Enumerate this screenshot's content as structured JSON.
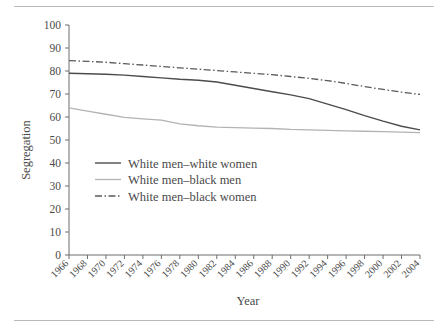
{
  "figure": {
    "top_rule": "horizontal-rule",
    "bottom_rule": "horizontal-rule"
  },
  "chart_data": {
    "type": "line",
    "title": "",
    "xlabel": "Year",
    "ylabel": "Segregation",
    "xlim": [
      1966,
      2004
    ],
    "ylim": [
      0,
      100
    ],
    "grid": false,
    "legend_position": "inside-lower-left",
    "yticks": [
      0,
      10,
      20,
      30,
      40,
      50,
      60,
      70,
      80,
      90,
      100
    ],
    "categories": [
      1966,
      1968,
      1970,
      1972,
      1974,
      1976,
      1978,
      1980,
      1982,
      1984,
      1986,
      1988,
      1990,
      1992,
      1994,
      1996,
      1998,
      2000,
      2002,
      2004
    ],
    "x": [
      1966,
      1968,
      1970,
      1972,
      1974,
      1976,
      1978,
      1980,
      1982,
      1984,
      1986,
      1988,
      1990,
      1992,
      1994,
      1996,
      1998,
      2000,
      2002,
      2004
    ],
    "series": [
      {
        "name": "White men–white women",
        "style": "solid",
        "color": "#4c4c4c",
        "values": [
          79.0,
          78.8,
          78.6,
          78.2,
          77.6,
          77.0,
          76.4,
          76.0,
          75.2,
          73.8,
          72.4,
          71.0,
          69.6,
          68.0,
          65.6,
          63.2,
          60.6,
          58.2,
          56.0,
          54.4
        ]
      },
      {
        "name": "White men–black men",
        "style": "solid",
        "color": "#b3b3b3",
        "values": [
          64.0,
          62.6,
          61.2,
          59.8,
          59.2,
          58.6,
          57.0,
          56.2,
          55.6,
          55.4,
          55.2,
          55.0,
          54.6,
          54.4,
          54.2,
          54.0,
          53.8,
          53.6,
          53.4,
          53.2
        ]
      },
      {
        "name": "White men–black women",
        "style": "dash-dot-dot",
        "color": "#5a5a5a",
        "values": [
          84.5,
          84.2,
          83.8,
          83.2,
          82.6,
          82.0,
          81.4,
          80.8,
          80.2,
          79.6,
          79.0,
          78.4,
          77.6,
          76.8,
          75.8,
          74.6,
          73.2,
          72.0,
          70.8,
          69.8
        ]
      }
    ],
    "xtick_labels": [
      "1966",
      "1968",
      "1970",
      "1972",
      "1974",
      "1976",
      "1978",
      "1980",
      "1982",
      "1984",
      "1986",
      "1988",
      "1990",
      "1992",
      "1994",
      "1996",
      "1998",
      "2000",
      "2002",
      "2004"
    ],
    "ytick_labels": [
      "0",
      "10",
      "20",
      "30",
      "40",
      "50",
      "60",
      "70",
      "80",
      "90",
      "100"
    ]
  }
}
